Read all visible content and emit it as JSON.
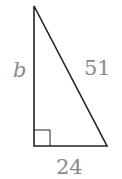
{
  "diagram": {
    "type": "right-triangle",
    "labels": {
      "vertical_leg": "b",
      "hypotenuse": "51",
      "base": "24"
    },
    "right_angle_marker": true,
    "colors": {
      "stroke": "#222222",
      "label": "#8a8a8a"
    }
  }
}
